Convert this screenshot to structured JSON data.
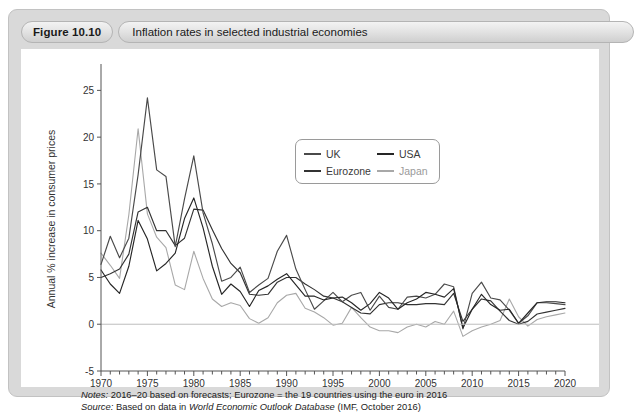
{
  "figure": {
    "number_label": "Figure 10.10",
    "title": "Inflation rates in selected industrial economies"
  },
  "footnotes": {
    "notes_label": "Notes:",
    "notes_text": " 2016–20 based on forecasts; Eurozone = the 19 countries using the euro in 2016",
    "source_label": "Source:",
    "source_text_before": " Based on data in ",
    "source_italic": "World Economic Outlook Database",
    "source_text_after": " (IMF, October 2016)"
  },
  "colors": {
    "uk": "#4a4a4a",
    "usa": "#262626",
    "eurozone": "#333333",
    "japan": "#a8a8a8",
    "axis": "#555555",
    "zero_line": "#bdbdbd",
    "panel_bg": "#d9d9d9",
    "canvas_bg": "#ffffff"
  },
  "chart_data": {
    "type": "line",
    "title": "Inflation rates in selected industrial economies",
    "xlabel": "",
    "ylabel": "Annual % increase in consumer prices",
    "xlim": [
      1970,
      2020
    ],
    "ylim": [
      -5,
      27.5
    ],
    "yticks": [
      -5,
      0,
      5,
      10,
      15,
      20,
      25
    ],
    "ytick_labels": [
      "-5",
      "0",
      "5",
      "10",
      "15",
      "20",
      "25"
    ],
    "xticks": [
      1970,
      1975,
      1980,
      1985,
      1990,
      1995,
      2000,
      2005,
      2010,
      2015,
      2020
    ],
    "xtick_labels": [
      "1970",
      "1975",
      "1980",
      "1985",
      "1990",
      "1995",
      "2000",
      "2005",
      "2010",
      "2015",
      "2020"
    ],
    "x_minor_tick_step": 1,
    "grid": false,
    "zero_line": true,
    "legend_position": "upper-center",
    "x": [
      1970,
      1971,
      1972,
      1973,
      1974,
      1975,
      1976,
      1977,
      1978,
      1979,
      1980,
      1981,
      1982,
      1983,
      1984,
      1985,
      1986,
      1987,
      1988,
      1989,
      1990,
      1991,
      1992,
      1993,
      1994,
      1995,
      1996,
      1997,
      1998,
      1999,
      2000,
      2001,
      2002,
      2003,
      2004,
      2005,
      2006,
      2007,
      2008,
      2009,
      2010,
      2011,
      2012,
      2013,
      2014,
      2015,
      2016,
      2017,
      2018,
      2019,
      2020
    ],
    "series": [
      {
        "name": "UK",
        "color": "#4a4a4a",
        "values": [
          6.4,
          9.4,
          7.1,
          9.2,
          16.0,
          24.2,
          16.5,
          15.8,
          8.3,
          13.4,
          18.0,
          11.9,
          8.6,
          4.6,
          5.0,
          6.1,
          3.4,
          4.2,
          4.9,
          7.8,
          9.5,
          5.9,
          3.7,
          1.6,
          2.5,
          3.4,
          2.4,
          3.1,
          3.4,
          1.5,
          3.0,
          1.8,
          1.6,
          2.9,
          3.0,
          2.8,
          3.2,
          4.3,
          4.0,
          -0.5,
          3.3,
          4.5,
          2.8,
          2.6,
          1.5,
          0.1,
          0.9,
          2.3,
          2.3,
          2.2,
          2.1
        ]
      },
      {
        "name": "USA",
        "color": "#262626",
        "values": [
          5.8,
          4.3,
          3.3,
          6.2,
          11.1,
          9.1,
          5.7,
          6.5,
          7.6,
          11.3,
          13.5,
          10.3,
          6.2,
          3.2,
          4.3,
          3.5,
          1.9,
          3.6,
          4.1,
          4.8,
          5.4,
          4.2,
          3.0,
          3.0,
          2.6,
          2.8,
          2.9,
          2.3,
          1.5,
          2.2,
          3.4,
          2.8,
          1.6,
          2.3,
          2.7,
          3.4,
          3.2,
          2.9,
          3.8,
          -0.4,
          1.6,
          3.2,
          2.1,
          1.5,
          1.6,
          0.1,
          1.2,
          2.3,
          2.4,
          2.4,
          2.3
        ]
      },
      {
        "name": "Eurozone",
        "color": "#333333",
        "values": [
          5.0,
          5.4,
          5.9,
          7.5,
          12.0,
          12.5,
          10.0,
          10.0,
          8.4,
          9.2,
          12.3,
          12.2,
          10.1,
          8.1,
          6.5,
          5.5,
          3.2,
          3.1,
          3.2,
          4.5,
          5.0,
          5.0,
          4.3,
          3.7,
          3.0,
          2.8,
          2.4,
          1.8,
          1.2,
          1.1,
          2.1,
          2.3,
          2.3,
          2.1,
          2.1,
          2.2,
          2.2,
          2.1,
          3.3,
          0.3,
          1.6,
          2.7,
          2.5,
          1.4,
          0.4,
          0.0,
          0.3,
          1.1,
          1.3,
          1.5,
          1.7
        ]
      },
      {
        "name": "Japan",
        "color": "#a8a8a8",
        "values": [
          7.6,
          6.3,
          4.9,
          11.7,
          20.9,
          11.8,
          9.3,
          8.2,
          4.2,
          3.7,
          7.8,
          4.9,
          2.7,
          1.9,
          2.3,
          2.0,
          0.6,
          0.1,
          0.7,
          2.3,
          3.1,
          3.3,
          1.7,
          1.3,
          0.7,
          -0.1,
          0.1,
          1.8,
          0.7,
          -0.3,
          -0.7,
          -0.7,
          -0.9,
          -0.3,
          0.0,
          -0.3,
          0.3,
          0.0,
          1.4,
          -1.3,
          -0.7,
          -0.3,
          0.0,
          0.4,
          2.7,
          0.8,
          -0.2,
          0.5,
          0.8,
          1.0,
          1.2
        ]
      }
    ],
    "legend": [
      {
        "label": "UK",
        "color": "#4a4a4a"
      },
      {
        "label": "USA",
        "color": "#262626"
      },
      {
        "label": "Eurozone",
        "color": "#333333"
      },
      {
        "label": "Japan",
        "color": "#a8a8a8"
      }
    ]
  }
}
